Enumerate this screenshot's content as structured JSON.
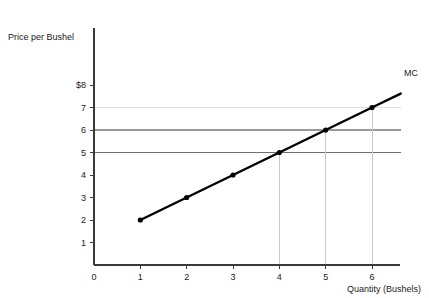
{
  "chart_data": {
    "type": "line",
    "title": "",
    "xlabel": "Quantity (Bushels)",
    "ylabel": "Price per Bushel",
    "xlim": [
      0,
      6.65
    ],
    "ylim": [
      0,
      8.6
    ],
    "grid": false,
    "legend_position": "inline-right",
    "x_ticks": [
      "0",
      "1",
      "2",
      "3",
      "4",
      "5",
      "6"
    ],
    "x_tick_values": [
      0,
      1,
      2,
      3,
      4,
      5,
      6
    ],
    "y_ticks": [
      "1",
      "2",
      "3",
      "4",
      "5",
      "6",
      "7",
      "$8"
    ],
    "y_tick_values": [
      1,
      2,
      3,
      4,
      5,
      6,
      7,
      8
    ],
    "series": [
      {
        "name": "MC",
        "label": "MC",
        "color": "#000000",
        "x": [
          1,
          2,
          3,
          4,
          5,
          6
        ],
        "values": [
          2,
          3,
          4,
          5,
          6,
          7
        ],
        "markers": true,
        "extend_to": {
          "x": 6.62,
          "y": 7.62
        }
      }
    ],
    "price_lines": [
      {
        "label": "7",
        "value": 7,
        "color": "#e0e0e0",
        "x_start": 0,
        "x_end": 6.62
      },
      {
        "label": "6",
        "value": 6,
        "color": "#9a9a9a",
        "x_start": 0,
        "x_end": 6.62
      },
      {
        "label": "5",
        "value": 5,
        "color": "#6e6e6e",
        "x_start": 0,
        "x_end": 6.62
      }
    ],
    "quantity_lines": [
      {
        "label": "4",
        "value": 4,
        "color": "#c8c8c8",
        "y_top": 5
      },
      {
        "label": "5",
        "value": 5,
        "color": "#c8c8c8",
        "y_top": 6
      },
      {
        "label": "6",
        "value": 6,
        "color": "#c8c8c8",
        "y_top": 7
      }
    ],
    "axis_color": "#3a3a3a"
  }
}
